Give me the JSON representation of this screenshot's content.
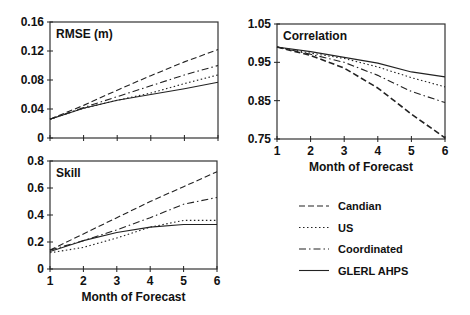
{
  "chart_data": [
    {
      "type": "line",
      "title": "RMSE (m)",
      "xlabel": "",
      "ylabel": "",
      "x": [
        1,
        2,
        3,
        4,
        5,
        6
      ],
      "ylim": [
        0,
        0.16
      ],
      "yticks": [
        "0",
        "0.04",
        "0.08",
        "0.12",
        "0.16"
      ],
      "xticks": [
        "1",
        "2",
        "3",
        "4",
        "5",
        "6"
      ],
      "show_xtick_labels": false,
      "series": [
        {
          "name": "Candian",
          "style": "dashed",
          "values": [
            0.026,
            0.045,
            0.066,
            0.086,
            0.105,
            0.122
          ]
        },
        {
          "name": "US",
          "style": "dotted",
          "values": [
            0.026,
            0.041,
            0.052,
            0.062,
            0.075,
            0.087
          ]
        },
        {
          "name": "Coordinated",
          "style": "dashdot",
          "values": [
            0.026,
            0.042,
            0.057,
            0.072,
            0.087,
            0.1
          ]
        },
        {
          "name": "GLERL AHPS",
          "style": "solid",
          "values": [
            0.026,
            0.041,
            0.052,
            0.06,
            0.068,
            0.077
          ]
        }
      ]
    },
    {
      "type": "line",
      "title": "Correlation",
      "xlabel": "Month of Forecast",
      "ylabel": "",
      "x": [
        1,
        2,
        3,
        4,
        5,
        6
      ],
      "ylim": [
        0.75,
        1.05
      ],
      "yticks": [
        "0.75",
        "0.85",
        "0.95",
        "1.05"
      ],
      "xticks": [
        "1",
        "2",
        "3",
        "4",
        "5",
        "6"
      ],
      "series": [
        {
          "name": "Candian",
          "style": "dashed",
          "values": [
            0.99,
            0.968,
            0.935,
            0.883,
            0.815,
            0.753
          ]
        },
        {
          "name": "US",
          "style": "dotted",
          "values": [
            0.99,
            0.974,
            0.96,
            0.938,
            0.91,
            0.886
          ]
        },
        {
          "name": "Coordinated",
          "style": "dashdot",
          "values": [
            0.99,
            0.971,
            0.95,
            0.916,
            0.874,
            0.845
          ]
        },
        {
          "name": "GLERL AHPS",
          "style": "solid",
          "values": [
            0.99,
            0.978,
            0.963,
            0.948,
            0.925,
            0.912
          ]
        }
      ]
    },
    {
      "type": "line",
      "title": "Skill",
      "xlabel": "Month of Forecast",
      "ylabel": "",
      "x": [
        1,
        2,
        3,
        4,
        5,
        6
      ],
      "ylim": [
        0,
        0.8
      ],
      "yticks": [
        "0",
        "0.2",
        "0.4",
        "0.6",
        "0.8"
      ],
      "xticks": [
        "1",
        "2",
        "3",
        "4",
        "5",
        "6"
      ],
      "series": [
        {
          "name": "Candian",
          "style": "dashed",
          "values": [
            0.14,
            0.26,
            0.38,
            0.5,
            0.61,
            0.72
          ]
        },
        {
          "name": "US",
          "style": "dotted",
          "values": [
            0.12,
            0.16,
            0.23,
            0.31,
            0.36,
            0.36
          ]
        },
        {
          "name": "Coordinated",
          "style": "dashdot",
          "values": [
            0.14,
            0.21,
            0.29,
            0.38,
            0.48,
            0.53
          ]
        },
        {
          "name": "GLERL AHPS",
          "style": "solid",
          "values": [
            0.13,
            0.21,
            0.27,
            0.31,
            0.33,
            0.33
          ]
        }
      ]
    }
  ],
  "legend": {
    "position": "bottom-right",
    "items": [
      {
        "label": "Candian",
        "style": "dashed"
      },
      {
        "label": "US",
        "style": "dotted"
      },
      {
        "label": "Coordinated",
        "style": "dashdot"
      },
      {
        "label": "GLERL AHPS",
        "style": "solid"
      }
    ]
  }
}
